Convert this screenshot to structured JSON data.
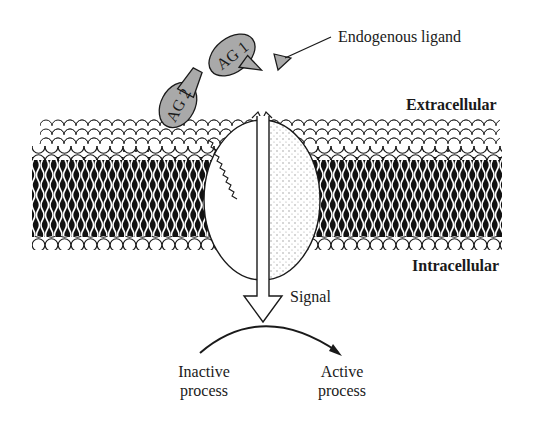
{
  "diagram": {
    "type": "cell-membrane-receptor-signaling",
    "labels": {
      "endogenous_ligand": "Endogenous ligand",
      "extracellular": "Extracellular",
      "intracellular": "Intracellular",
      "signal": "Signal",
      "inactive_line1": "Inactive",
      "inactive_line2": "process",
      "active_line1": "Active",
      "active_line2": "process"
    },
    "agonists": [
      {
        "id": "ag1",
        "label": "AG 1"
      },
      {
        "id": "ag2",
        "label": "AG 2"
      }
    ],
    "colors": {
      "agonist_fill": "#a9a9a9",
      "ligand_fill": "#a9a9a9",
      "stroke": "#1a1a1a",
      "background": "#ffffff"
    }
  }
}
